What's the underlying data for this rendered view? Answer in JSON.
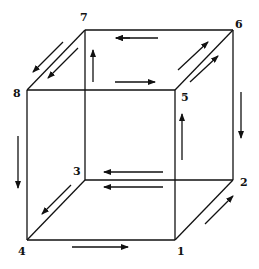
{
  "diagram": {
    "type": "cube-graph",
    "vertices": [
      {
        "id": "1",
        "label": "1",
        "x": 175,
        "y": 240,
        "lx": 177,
        "ly": 246
      },
      {
        "id": "2",
        "label": "2",
        "x": 233,
        "y": 180,
        "lx": 240,
        "ly": 177
      },
      {
        "id": "3",
        "label": "3",
        "x": 85,
        "y": 180,
        "lx": 73,
        "ly": 166
      },
      {
        "id": "4",
        "label": "4",
        "x": 27,
        "y": 240,
        "lx": 18,
        "ly": 246
      },
      {
        "id": "5",
        "label": "5",
        "x": 175,
        "y": 90,
        "lx": 181,
        "ly": 92
      },
      {
        "id": "6",
        "label": "6",
        "x": 233,
        "y": 30,
        "lx": 235,
        "ly": 19
      },
      {
        "id": "7",
        "label": "7",
        "x": 85,
        "y": 30,
        "lx": 80,
        "ly": 12
      },
      {
        "id": "8",
        "label": "8",
        "x": 27,
        "y": 90,
        "lx": 13,
        "ly": 88
      }
    ],
    "edges": [
      [
        "7",
        "6"
      ],
      [
        "6",
        "2"
      ],
      [
        "2",
        "1"
      ],
      [
        "1",
        "4"
      ],
      [
        "4",
        "8"
      ],
      [
        "8",
        "7"
      ],
      [
        "8",
        "5"
      ],
      [
        "5",
        "6"
      ],
      [
        "5",
        "1"
      ],
      [
        "7",
        "3"
      ],
      [
        "3",
        "2"
      ],
      [
        "3",
        "4"
      ]
    ],
    "arrows": [
      {
        "from": [
          130,
          38
        ],
        "to": [
          116,
          38
        ],
        "note": "6 to 7 direction"
      },
      {
        "from": [
          158,
          38
        ],
        "to": [
          116,
          38
        ],
        "note": "top edge, pointing left"
      },
      {
        "from": [
          93,
          82
        ],
        "to": [
          93,
          50
        ],
        "note": "up along 3-7"
      },
      {
        "from": [
          115,
          82
        ],
        "to": [
          155,
          82
        ],
        "note": "right, toward 5"
      },
      {
        "from": [
          63,
          42
        ],
        "to": [
          33,
          72
        ],
        "note": "7 to 8 outer"
      },
      {
        "from": [
          78,
          48
        ],
        "to": [
          48,
          78
        ],
        "note": "7 to 8 inner"
      },
      {
        "from": [
          178,
          70
        ],
        "to": [
          208,
          42
        ],
        "note": "5 to 6 outer"
      },
      {
        "from": [
          190,
          82
        ],
        "to": [
          218,
          56
        ],
        "note": "5 to 6 inner"
      },
      {
        "from": [
          241,
          92
        ],
        "to": [
          241,
          138
        ],
        "note": "down along 6-2"
      },
      {
        "from": [
          182,
          160
        ],
        "to": [
          182,
          114
        ],
        "note": "up toward 5"
      },
      {
        "from": [
          18,
          136
        ],
        "to": [
          18,
          188
        ],
        "note": "down along 8-4"
      },
      {
        "from": [
          163,
          172
        ],
        "to": [
          104,
          172
        ],
        "note": "left toward 3 upper"
      },
      {
        "from": [
          163,
          187
        ],
        "to": [
          104,
          187
        ],
        "note": "left toward 3 lower"
      },
      {
        "from": [
          71,
          185
        ],
        "to": [
          42,
          214
        ],
        "note": "3 to 4"
      },
      {
        "from": [
          72,
          247
        ],
        "to": [
          128,
          247
        ],
        "note": "4 to 1"
      },
      {
        "from": [
          205,
          224
        ],
        "to": [
          233,
          196
        ],
        "note": "1 to 2"
      }
    ],
    "colors": {
      "line": "#111111",
      "background": "#ffffff"
    }
  }
}
